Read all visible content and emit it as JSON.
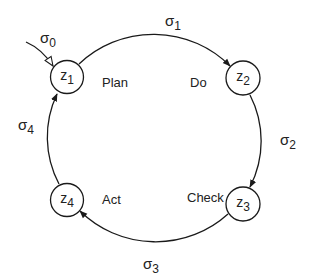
{
  "diagram": {
    "type": "state-cycle",
    "colors": {
      "stroke": "#1a1a1a",
      "text": "#222222",
      "background": "#ffffff"
    },
    "nodes": [
      {
        "id": "z1",
        "symbol": "z",
        "index": "1",
        "phase": "Plan"
      },
      {
        "id": "z2",
        "symbol": "z",
        "index": "2",
        "phase": "Do"
      },
      {
        "id": "z3",
        "symbol": "z",
        "index": "3",
        "phase": "Check"
      },
      {
        "id": "z4",
        "symbol": "z",
        "index": "4",
        "phase": "Act"
      }
    ],
    "transitions": [
      {
        "id": "s0",
        "symbol": "σ",
        "index": "0",
        "from": "",
        "to": "z1",
        "arrowhead": "hollow"
      },
      {
        "id": "s1",
        "symbol": "σ",
        "index": "1",
        "from": "z1",
        "to": "z2",
        "arrowhead": "filled"
      },
      {
        "id": "s2",
        "symbol": "σ",
        "index": "2",
        "from": "z2",
        "to": "z3",
        "arrowhead": "filled"
      },
      {
        "id": "s3",
        "symbol": "σ",
        "index": "3",
        "from": "z3",
        "to": "z4",
        "arrowhead": "filled"
      },
      {
        "id": "s4",
        "symbol": "σ",
        "index": "4",
        "from": "z4",
        "to": "z1",
        "arrowhead": "filled"
      }
    ]
  }
}
